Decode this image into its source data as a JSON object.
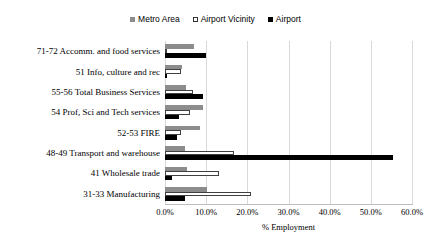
{
  "legend": {
    "position": "top-center",
    "entries": [
      {
        "label": "Metro Area",
        "icon": "square-filled-gray-icon",
        "color": "#8c8c8c"
      },
      {
        "label": "Airport Vicinity",
        "icon": "square-outline-icon",
        "color": "#ffffff"
      },
      {
        "label": "Airport",
        "icon": "square-filled-black-icon",
        "color": "#000000"
      }
    ]
  },
  "axis": {
    "x_title": "% Employment",
    "x_ticks": [
      "0.0%",
      "10.0%",
      "20.0%",
      "30.0%",
      "40.0%",
      "50.0%",
      "60.0%"
    ]
  },
  "chart_data": {
    "type": "bar",
    "orientation": "horizontal",
    "title": "",
    "subtitle": "",
    "xlabel": "% Employment",
    "ylabel": "",
    "xlim": [
      0,
      60
    ],
    "xtick_step": 10,
    "grid": true,
    "legend_position": "top-center",
    "categories": [
      "71-72 Accomm. and food services",
      "51 Info, culture and rec",
      "55-56 Total Business Services",
      "54 Prof, Sci and Tech services",
      "52-53 FIRE",
      "48-49 Transport and warehouse",
      "41 Wholesale trade",
      "31-33 Manufacturing"
    ],
    "series": [
      {
        "name": "Metro Area",
        "color": "#8c8c8c",
        "values": [
          7.0,
          4.2,
          5.0,
          9.3,
          8.6,
          4.8,
          5.3,
          10.2
        ]
      },
      {
        "name": "Airport Vicinity",
        "color": "#ffffff",
        "values": [
          0.6,
          3.9,
          6.8,
          6.0,
          4.0,
          16.8,
          13.2,
          21.0
        ]
      },
      {
        "name": "Airport",
        "color": "#000000",
        "values": [
          10.0,
          0.5,
          9.3,
          3.3,
          3.0,
          55.5,
          1.8,
          4.8
        ]
      }
    ]
  }
}
